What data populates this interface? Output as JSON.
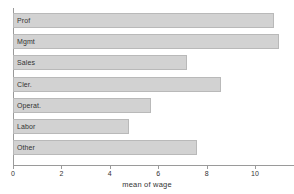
{
  "chart_data": {
    "type": "bar",
    "orientation": "horizontal",
    "title": "",
    "subtitle": "",
    "xlabel": "mean of wage",
    "ylabel": "",
    "categories": [
      "Prof",
      "Mgmt",
      "Sales",
      "Cler.",
      "Operat.",
      "Labor",
      "Other"
    ],
    "values": [
      10.8,
      11.0,
      7.2,
      8.6,
      5.7,
      4.8,
      7.6
    ],
    "xlim": [
      0,
      11.6
    ],
    "xticks": [
      0,
      2,
      4,
      6,
      8,
      10
    ],
    "xticklabels": [
      "0",
      "2",
      "4",
      "6",
      "8",
      "10"
    ],
    "yticklabels": [],
    "grid": false,
    "legend": false,
    "bar_fill_color": "#d2d2d2",
    "bar_edge_color": "#b9b9b9",
    "axis_color": "#9a9a9a",
    "background_color": "#ffffff",
    "text_color": "#333333",
    "bar_label_placement": "inside-left"
  }
}
